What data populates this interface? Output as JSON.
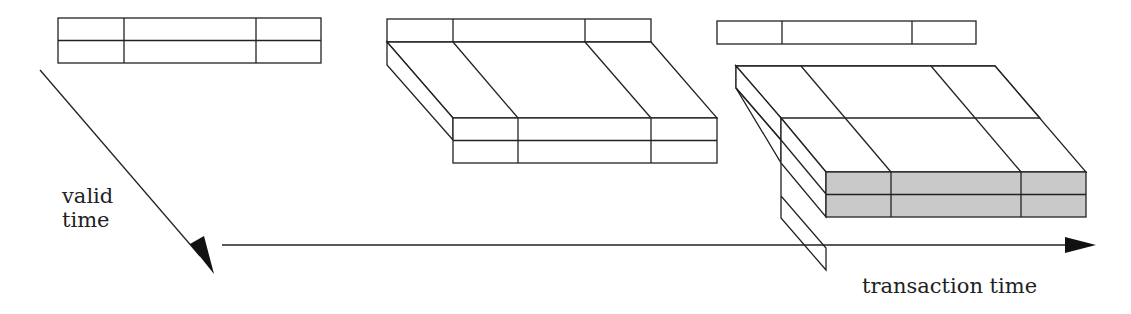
{
  "diagram": {
    "title": "",
    "labels": {
      "valid_time_line1": "valid",
      "valid_time_line2": "time",
      "transaction_time": "transaction time"
    },
    "axes": [
      {
        "name": "valid time",
        "direction": "diagonal down-right"
      },
      {
        "name": "transaction time",
        "direction": "horizontal right"
      }
    ],
    "structures": [
      {
        "name": "snapshot relation",
        "description": "flat table, 3 columns x 2 rows"
      },
      {
        "name": "valid-time relation",
        "description": "table with header row extended along valid time, 3 columns x 2 rows"
      },
      {
        "name": "bitemporal relation",
        "description": "table with header row extended along valid time and transaction time; current slice shaded"
      }
    ],
    "colors": {
      "line": "#222222",
      "shaded": "#c9c9c9",
      "background": "#ffffff"
    }
  }
}
